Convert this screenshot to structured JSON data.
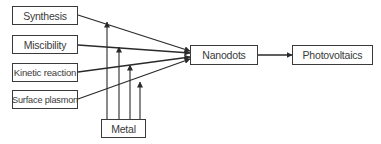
{
  "diagram": {
    "inputs": [
      {
        "id": "synthesis",
        "label": "Synthesis"
      },
      {
        "id": "miscibility",
        "label": "Miscibility"
      },
      {
        "id": "kinetic-reaction",
        "label": "Kinetic reaction"
      },
      {
        "id": "surface-plasmon",
        "label": "Surface plasmon"
      }
    ],
    "modifier": {
      "id": "metal",
      "label": "Metal"
    },
    "hub": {
      "id": "nanodots",
      "label": "Nanodots"
    },
    "output": {
      "id": "photovoltaics",
      "label": "Photovoltaics"
    },
    "edges": [
      {
        "from": "Synthesis",
        "to": "Nanodots"
      },
      {
        "from": "Miscibility",
        "to": "Nanodots"
      },
      {
        "from": "Kinetic reaction",
        "to": "Nanodots"
      },
      {
        "from": "Surface plasmon",
        "to": "Nanodots"
      },
      {
        "from": "Metal",
        "to": "Synthesis→Nanodots"
      },
      {
        "from": "Metal",
        "to": "Miscibility→Nanodots"
      },
      {
        "from": "Metal",
        "to": "Kinetic reaction→Nanodots"
      },
      {
        "from": "Metal",
        "to": "Surface plasmon→Nanodots"
      },
      {
        "from": "Nanodots",
        "to": "Photovoltaics"
      }
    ],
    "colors": {
      "stroke": "#2a2a2a",
      "text": "#3a3a3a",
      "background": "#ffffff"
    }
  }
}
